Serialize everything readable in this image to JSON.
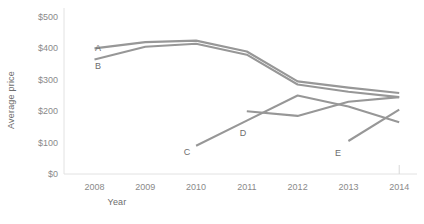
{
  "chart_data": {
    "type": "line",
    "title": "",
    "xlabel": "Year",
    "ylabel": "Average price",
    "x": [
      2008,
      2009,
      2010,
      2011,
      2012,
      2013,
      2014
    ],
    "xtick_labels": [
      "2008",
      "2009",
      "2010",
      "2011",
      "2012",
      "2013",
      "2014"
    ],
    "ytick_labels": [
      "$0",
      "$100",
      "$200",
      "$300",
      "$400",
      "$500"
    ],
    "ytick_values": [
      0,
      100,
      200,
      300,
      400,
      500
    ],
    "ylim": [
      0,
      500
    ],
    "xlim": [
      2007.4,
      2014.35
    ],
    "grid": false,
    "legend": "inline-series-labels",
    "line_color": "#979797",
    "series": [
      {
        "name": "A",
        "label": "A",
        "x": [
          2008,
          2009,
          2010,
          2011,
          2012,
          2013,
          2014
        ],
        "values": [
          400,
          420,
          425,
          390,
          295,
          275,
          258
        ]
      },
      {
        "name": "B",
        "label": "B",
        "x": [
          2008,
          2009,
          2010,
          2011,
          2012,
          2013,
          2014
        ],
        "values": [
          365,
          405,
          415,
          380,
          285,
          262,
          245
        ]
      },
      {
        "name": "C",
        "label": "C",
        "x": [
          2010,
          2011,
          2012,
          2013,
          2014
        ],
        "values": [
          90,
          170,
          250,
          215,
          165
        ]
      },
      {
        "name": "D",
        "label": "D",
        "x": [
          2011,
          2012,
          2013,
          2014
        ],
        "values": [
          200,
          185,
          230,
          245
        ]
      },
      {
        "name": "E",
        "label": "E",
        "x": [
          2013,
          2014
        ],
        "values": [
          105,
          205
        ]
      }
    ],
    "series_label_positions": [
      {
        "name": "A",
        "x": 98,
        "y": 48
      },
      {
        "name": "B",
        "x": 98,
        "y": 66
      },
      {
        "name": "C",
        "x": 187,
        "y": 152
      },
      {
        "name": "D",
        "x": 243,
        "y": 133
      },
      {
        "name": "E",
        "x": 338,
        "y": 153
      }
    ]
  }
}
